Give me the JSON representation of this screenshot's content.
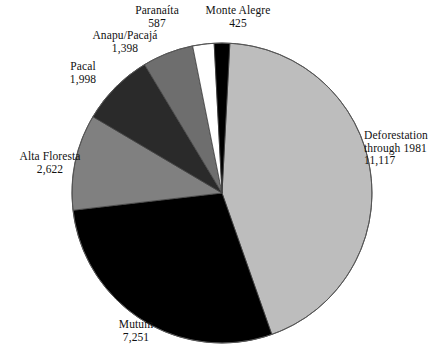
{
  "chart_data": {
    "type": "pie",
    "title": "",
    "subtitle": "",
    "xlabel": "",
    "ylabel": "",
    "legend_position": "none",
    "grid": false,
    "total": 25398,
    "units": "hectares",
    "categories": [
      "Deforestation through 1981",
      "Mutum",
      "Alta Floresta",
      "Pacal",
      "Anapu/Pacajá",
      "Paranaíta",
      "Monte Alegre"
    ],
    "values": [
      11117,
      7251,
      2622,
      1998,
      1398,
      587,
      425
    ],
    "value_labels": [
      "11,117",
      "7,251",
      "2,622",
      "1,998",
      "1,398",
      "587",
      "425"
    ],
    "colors": [
      "#bdbdbd",
      "#000000",
      "#808080",
      "#2a2a2a",
      "#6e6e6e",
      "#ffffff",
      "#000000"
    ],
    "slices": [
      {
        "name": "Deforestation through 1981",
        "name_line1": "Deforestation",
        "name_line2": "through 1981",
        "value": 11117,
        "value_label": "11,117",
        "color": "#bdbdbd",
        "start_angle": 3.0,
        "sweep_angle": 157.6
      },
      {
        "name": "Mutum",
        "value": 7251,
        "value_label": "7,251",
        "color": "#000000",
        "start_angle": 160.6,
        "sweep_angle": 102.8
      },
      {
        "name": "Alta Floresta",
        "value": 2622,
        "value_label": "2,622",
        "color": "#808080",
        "start_angle": 263.4,
        "sweep_angle": 37.2
      },
      {
        "name": "Pacal",
        "value": 1998,
        "value_label": "1,998",
        "color": "#2a2a2a",
        "start_angle": 300.6,
        "sweep_angle": 28.3
      },
      {
        "name": "Anapu/Pacajá",
        "value": 1398,
        "value_label": "1,398",
        "color": "#6e6e6e",
        "start_angle": 328.9,
        "sweep_angle": 19.8
      },
      {
        "name": "Paranaíta",
        "value": 587,
        "value_label": "587",
        "color": "#ffffff",
        "start_angle": 348.7,
        "sweep_angle": 8.3
      },
      {
        "name": "Monte Alegre",
        "value": 425,
        "value_label": "425",
        "color": "#000000",
        "start_angle": 357.0,
        "sweep_angle": 6.0
      }
    ],
    "geometry": {
      "center_x": 222,
      "center_y": 193,
      "radius": 150,
      "outline_color": "#555555"
    }
  }
}
